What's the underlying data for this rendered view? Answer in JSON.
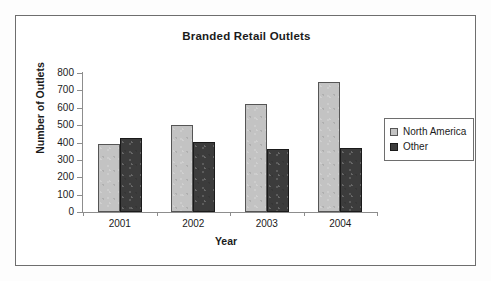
{
  "chart_data": {
    "type": "bar",
    "title": "Branded Retail Outlets",
    "xlabel": "Year",
    "ylabel": "Number of Outlets",
    "categories": [
      "2001",
      "2002",
      "2003",
      "2004"
    ],
    "series": [
      {
        "name": "North America",
        "color": "#c3c3c3",
        "values": [
          390,
          500,
          620,
          750
        ]
      },
      {
        "name": "Other",
        "color": "#3c3c3c",
        "values": [
          425,
          405,
          365,
          370
        ]
      }
    ],
    "ylim": [
      0,
      800
    ],
    "ytick_labels": [
      "800",
      "700",
      "600",
      "500",
      "400",
      "300",
      "200",
      "100",
      "0"
    ],
    "ytick_values": [
      800,
      700,
      600,
      500,
      400,
      300,
      200,
      100,
      0
    ],
    "grid": false,
    "legend_position": "right"
  },
  "legend": {
    "items": [
      {
        "label": "North America",
        "swatch": "light-gray-swatch"
      },
      {
        "label": "Other",
        "swatch": "dark-gray-swatch"
      }
    ]
  }
}
